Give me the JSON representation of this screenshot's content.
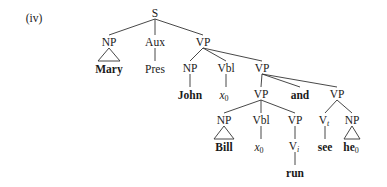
{
  "example_label": "(iv)",
  "tree": {
    "root": "S",
    "nodes": {
      "s": "S",
      "np_mary": "NP",
      "mary": "Mary",
      "aux": "Aux",
      "pres": "Pres",
      "vp1": "VP",
      "np_john": "NP",
      "john": "John",
      "vbl1": "Vbl",
      "x0_1": "x",
      "x0_1_sub": "0",
      "vp2": "VP",
      "vp3": "VP",
      "and": "and",
      "vp4": "VP",
      "np_bill": "NP",
      "bill": "Bill",
      "vbl2": "Vbl",
      "x0_2": "x",
      "x0_2_sub": "0",
      "vp5": "VP",
      "vi": "V",
      "vi_sub": "i",
      "run": "run",
      "vt": "V",
      "vt_sub": "t",
      "see": "see",
      "np_he": "NP",
      "he": "he",
      "he_sub": "0"
    }
  }
}
